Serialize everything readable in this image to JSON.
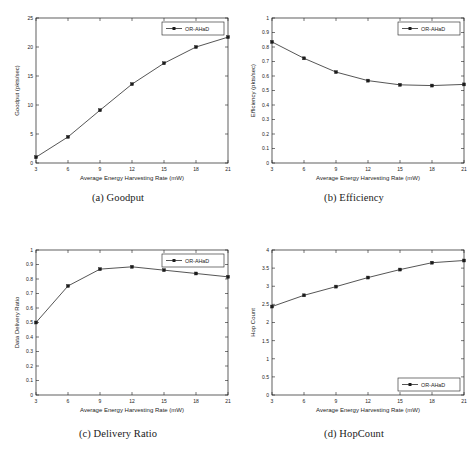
{
  "figure": {
    "panels": [
      {
        "id": "a",
        "caption": "(a) Goodput",
        "legend_label": "OR-AHaD",
        "legend_position": "top-right"
      },
      {
        "id": "b",
        "caption": "(b) Efficiency",
        "legend_label": "OR-AHaD",
        "legend_position": "top-right"
      },
      {
        "id": "c",
        "caption": "(c) Delivery Ratio",
        "legend_label": "OR-AHaD",
        "legend_position": "top-right"
      },
      {
        "id": "d",
        "caption": "(d) HopCount",
        "legend_label": "OR-AHaD",
        "legend_position": "bottom-right"
      }
    ]
  },
  "chart_data": [
    {
      "type": "line",
      "title": "",
      "xlabel": "Average Energy Harvesting Rate (mW)",
      "ylabel": "Goodput (pkts/sec)",
      "x": [
        3,
        6,
        9,
        12,
        15,
        18,
        21
      ],
      "xticklabels": [
        "3",
        "6",
        "9",
        "12",
        "15",
        "18",
        "21"
      ],
      "yticklabels": [
        "0",
        "5",
        "10",
        "15",
        "20",
        "25"
      ],
      "yticks": [
        0,
        5,
        10,
        15,
        20,
        25
      ],
      "xlim": [
        3,
        21
      ],
      "ylim": [
        0,
        25
      ],
      "grid": false,
      "legend": [
        "OR-AHaD"
      ],
      "legend_position": "upper right",
      "marker": "square",
      "series": [
        {
          "name": "OR-AHaD",
          "values": [
            1.0,
            4.5,
            9.1,
            13.6,
            17.2,
            20.0,
            21.7
          ]
        }
      ]
    },
    {
      "type": "line",
      "title": "",
      "xlabel": "Average Energy Harvesting Rate (mW)",
      "ylabel": "Efficiency (pkts/sec)",
      "x": [
        3,
        6,
        9,
        12,
        15,
        18,
        21
      ],
      "xticklabels": [
        "3",
        "6",
        "9",
        "12",
        "15",
        "18",
        "21"
      ],
      "yticklabels": [
        "0",
        "0.1",
        "0.2",
        "0.3",
        "0.4",
        "0.5",
        "0.6",
        "0.7",
        "0.8",
        "0.9",
        "1"
      ],
      "yticks": [
        0,
        0.1,
        0.2,
        0.3,
        0.4,
        0.5,
        0.6,
        0.7,
        0.8,
        0.9,
        1
      ],
      "xlim": [
        3,
        21
      ],
      "ylim": [
        0,
        1
      ],
      "grid": false,
      "legend": [
        "OR-AHaD"
      ],
      "legend_position": "upper right",
      "marker": "square",
      "series": [
        {
          "name": "OR-AHaD",
          "values": [
            0.835,
            0.722,
            0.627,
            0.568,
            0.539,
            0.534,
            0.542
          ]
        }
      ]
    },
    {
      "type": "line",
      "title": "",
      "xlabel": "Average Energy Harvesting Rate (mW)",
      "ylabel": "Data Delivery Ratio",
      "x": [
        3,
        6,
        9,
        12,
        15,
        18,
        21
      ],
      "xticklabels": [
        "3",
        "6",
        "9",
        "12",
        "15",
        "18",
        "21"
      ],
      "yticklabels": [
        "0",
        "0.1",
        "0.2",
        "0.3",
        "0.4",
        "0.5",
        "0.6",
        "0.7",
        "0.8",
        "0.9",
        "1"
      ],
      "yticks": [
        0,
        0.1,
        0.2,
        0.3,
        0.4,
        0.5,
        0.6,
        0.7,
        0.8,
        0.9,
        1
      ],
      "xlim": [
        3,
        21
      ],
      "ylim": [
        0,
        1
      ],
      "grid": false,
      "legend": [
        "OR-AHaD"
      ],
      "legend_position": "upper right",
      "marker": "square",
      "series": [
        {
          "name": "OR-AHaD",
          "values": [
            0.5,
            0.752,
            0.868,
            0.884,
            0.861,
            0.838,
            0.815
          ]
        }
      ]
    },
    {
      "type": "line",
      "title": "",
      "xlabel": "Average Energy Harvesting Rate (mW)",
      "ylabel": "Hop Count",
      "x": [
        3,
        6,
        9,
        12,
        15,
        18,
        21
      ],
      "xticklabels": [
        "3",
        "6",
        "9",
        "12",
        "15",
        "18",
        "21"
      ],
      "yticklabels": [
        "0",
        "0.5",
        "1",
        "1.5",
        "2",
        "2.5",
        "3",
        "3.5",
        "4"
      ],
      "yticks": [
        0,
        0.5,
        1,
        1.5,
        2,
        2.5,
        3,
        3.5,
        4
      ],
      "xlim": [
        3,
        21
      ],
      "ylim": [
        0,
        4
      ],
      "grid": false,
      "legend": [
        "OR-AHaD"
      ],
      "legend_position": "lower right",
      "marker": "square",
      "series": [
        {
          "name": "OR-AHaD",
          "values": [
            2.44,
            2.75,
            2.99,
            3.24,
            3.46,
            3.65,
            3.71
          ]
        }
      ]
    }
  ]
}
